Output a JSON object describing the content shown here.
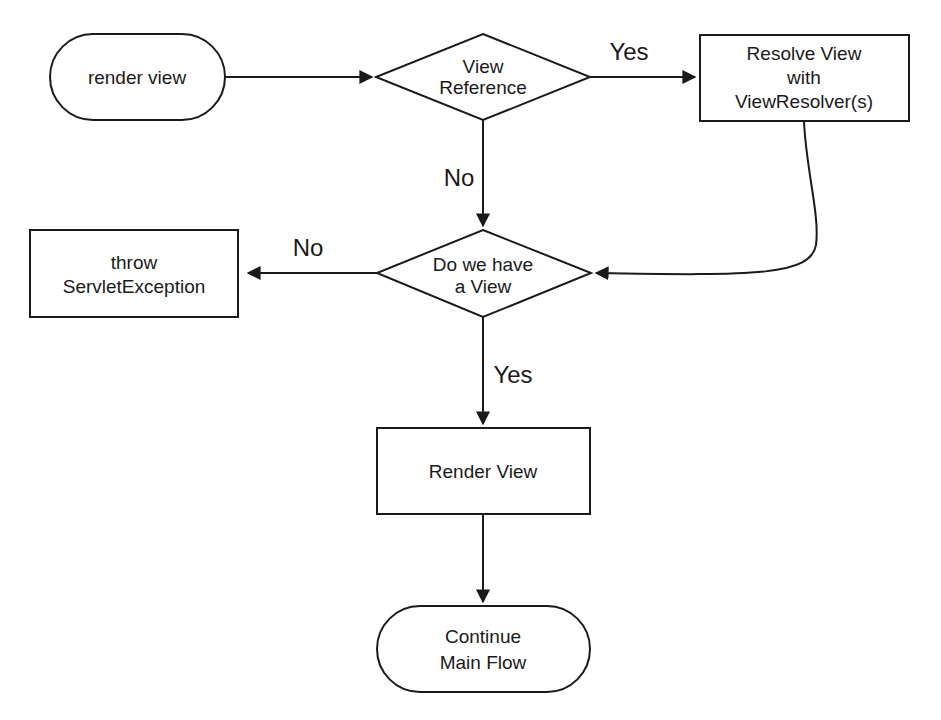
{
  "diagram": {
    "type": "flowchart",
    "nodes": {
      "render_view_start": {
        "shape": "terminator",
        "lines": [
          "render view"
        ]
      },
      "view_reference": {
        "shape": "decision",
        "lines": [
          "View",
          "Reference"
        ]
      },
      "resolve_view": {
        "shape": "process",
        "lines": [
          "Resolve View",
          "with",
          "ViewResolver(s)"
        ]
      },
      "have_view": {
        "shape": "decision",
        "lines": [
          "Do we have",
          "a View"
        ]
      },
      "throw_exception": {
        "shape": "process",
        "lines": [
          "throw",
          "ServletException"
        ]
      },
      "render_view": {
        "shape": "process",
        "lines": [
          "Render View"
        ]
      },
      "continue_main": {
        "shape": "terminator",
        "lines": [
          "Continue",
          "Main Flow"
        ]
      }
    },
    "edges": [
      {
        "from": "render_view_start",
        "to": "view_reference",
        "label": ""
      },
      {
        "from": "view_reference",
        "to": "resolve_view",
        "label": "Yes"
      },
      {
        "from": "view_reference",
        "to": "have_view",
        "label": "No"
      },
      {
        "from": "resolve_view",
        "to": "have_view",
        "label": ""
      },
      {
        "from": "have_view",
        "to": "throw_exception",
        "label": "No"
      },
      {
        "from": "have_view",
        "to": "render_view",
        "label": "Yes"
      },
      {
        "from": "render_view",
        "to": "continue_main",
        "label": ""
      }
    ],
    "edge_labels": {
      "ref_yes": "Yes",
      "ref_no": "No",
      "have_no": "No",
      "have_yes": "Yes"
    }
  }
}
